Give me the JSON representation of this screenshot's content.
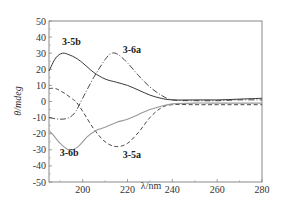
{
  "chart_data": {
    "type": "line",
    "title": "",
    "xlabel": "λ/nm",
    "ylabel": "θ/mdeg",
    "xlim": [
      185,
      280
    ],
    "ylim": [
      -50,
      50
    ],
    "xticks": [
      200,
      220,
      240,
      260,
      280
    ],
    "yticks": [
      50,
      40,
      30,
      20,
      10,
      0,
      -10,
      -20,
      -30,
      -40,
      -50
    ],
    "grid": false,
    "legend": "inline labels",
    "series": [
      {
        "name": "3-5b",
        "style": "solid",
        "color": "#222222",
        "x": [
          185,
          188,
          191,
          194,
          197,
          200,
          205,
          210,
          215,
          220,
          225,
          230,
          235,
          240,
          250,
          260,
          270,
          280
        ],
        "y": [
          19,
          27,
          30,
          29,
          27,
          24,
          18,
          14,
          12,
          10,
          7,
          4,
          2,
          1,
          1,
          1,
          1.5,
          2
        ]
      },
      {
        "name": "3-6a",
        "style": "dashdot",
        "color": "#333333",
        "x": [
          185,
          190,
          194,
          197,
          200,
          205,
          210,
          213,
          216,
          220,
          225,
          230,
          235,
          240,
          250,
          260,
          270,
          280
        ],
        "y": [
          -10,
          -11,
          -10,
          -6,
          2,
          15,
          26,
          30,
          29,
          24,
          16,
          9,
          4,
          1,
          0.5,
          0.5,
          1,
          1
        ]
      },
      {
        "name": "3-5a",
        "style": "dashed",
        "color": "#333333",
        "x": [
          185,
          188,
          192,
          196,
          197,
          200,
          205,
          210,
          215,
          220,
          225,
          230,
          235,
          240,
          250,
          260,
          270,
          280
        ],
        "y": [
          8,
          8,
          5,
          1,
          0,
          -6,
          -17,
          -25,
          -28,
          -26,
          -19,
          -10,
          -4,
          -2,
          -2,
          -2,
          -2,
          -2
        ]
      },
      {
        "name": "3-6b",
        "style": "solid",
        "color": "#999999",
        "x": [
          185,
          187,
          190,
          194,
          198,
          202,
          206,
          210,
          215,
          220,
          225,
          230,
          235,
          240,
          250,
          260,
          270,
          280
        ],
        "y": [
          -18,
          -21,
          -26,
          -30,
          -28,
          -22,
          -18,
          -16,
          -13,
          -11,
          -8,
          -5,
          -3,
          -1.5,
          -1,
          -1,
          -1,
          -1
        ]
      }
    ],
    "annotations": [
      {
        "text": "3-5b",
        "x": 195,
        "y": 35
      },
      {
        "text": "3-6a",
        "x": 222,
        "y": 30
      },
      {
        "text": "3-5a",
        "x": 222,
        "y": -35
      },
      {
        "text": "3-6b",
        "x": 194,
        "y": -34
      }
    ]
  },
  "labels": {
    "xlabel": "λ/nm",
    "ylabel": "θ/mdeg",
    "curve_3_5b": "3-5b",
    "curve_3_6a": "3-6a",
    "curve_3_5a": "3-5a",
    "curve_3_6b": "3-6b"
  }
}
